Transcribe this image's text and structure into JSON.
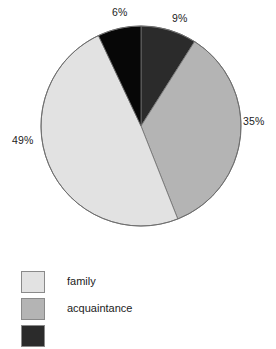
{
  "chart_data": {
    "type": "pie",
    "title": "",
    "categories": [
      "family",
      "acquaintance",
      "stranger",
      "other"
    ],
    "values": [
      49,
      35,
      9,
      6
    ],
    "labels": [
      "49%",
      "35%",
      "9%",
      "6%"
    ],
    "colors": [
      "#e2e2e2",
      "#b4b4b4",
      "#2b2b2b",
      "#070707"
    ],
    "legend_position": "bottom-left",
    "grid": false,
    "start_angle_deg": 0,
    "direction": "clockwise",
    "slice_order_clockwise_from_top": [
      "9%",
      "35%",
      "49%",
      "6%"
    ],
    "slices": [
      {
        "label": "9%",
        "value": 9,
        "color": "#2b2b2b",
        "start_deg": 0,
        "end_deg": 32.4
      },
      {
        "label": "35%",
        "value": 35,
        "color": "#b4b4b4",
        "start_deg": 32.4,
        "end_deg": 158.4
      },
      {
        "label": "49%",
        "value": 49,
        "color": "#e2e2e2",
        "start_deg": 158.4,
        "end_deg": 334.8
      },
      {
        "label": "6%",
        "value": 6,
        "color": "#070707",
        "start_deg": 334.8,
        "end_deg": 360
      }
    ],
    "geometry": {
      "cx": 141,
      "cy": 126,
      "r": 100,
      "stroke": "#6e6e6e"
    }
  },
  "pie": {
    "pct_6": "6%",
    "pct_9": "9%",
    "pct_35": "35%",
    "pct_49": "49%"
  },
  "legend": {
    "items": [
      {
        "label": "family",
        "color": "#e2e2e2"
      },
      {
        "label": "acquaintance",
        "color": "#b4b4b4"
      },
      {
        "label": "",
        "color": "#2b2b2b"
      }
    ]
  }
}
